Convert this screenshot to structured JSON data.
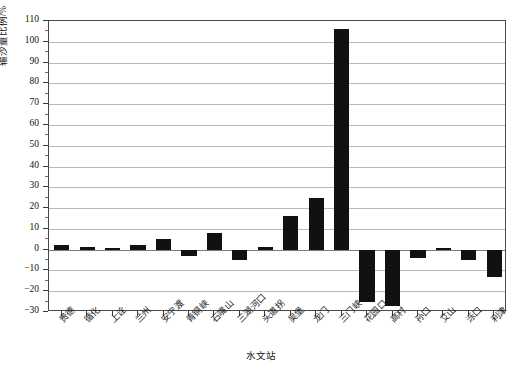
{
  "chart_data": {
    "type": "bar",
    "title": "",
    "subtitle": "",
    "xlabel": "水文站",
    "ylabel": "输沙量比例/%",
    "ylim": [
      -30,
      110
    ],
    "ytick_step": 10,
    "grid": true,
    "legend": null,
    "bar_color": "#111111",
    "categories": [
      "贵德",
      "循化",
      "上诠",
      "兰州",
      "安宁渡",
      "青铜峡",
      "石嘴山",
      "三湖河口",
      "头道拐",
      "吴堡",
      "龙门",
      "三门峡",
      "花园口",
      "高村",
      "孙口",
      "艾山",
      "泺口",
      "利津"
    ],
    "values": [
      2,
      1.5,
      0.8,
      2,
      5,
      -3,
      8,
      -5,
      1.5,
      16,
      25,
      106,
      -25,
      -27,
      -4,
      1,
      -5,
      -13
    ],
    "yticks": [
      -30,
      -20,
      -10,
      0,
      10,
      20,
      30,
      40,
      50,
      60,
      70,
      80,
      90,
      100,
      110
    ]
  },
  "axis": {
    "y_title": "输沙量比例/%",
    "x_title": "水文站"
  },
  "caption": {
    "text": ""
  }
}
